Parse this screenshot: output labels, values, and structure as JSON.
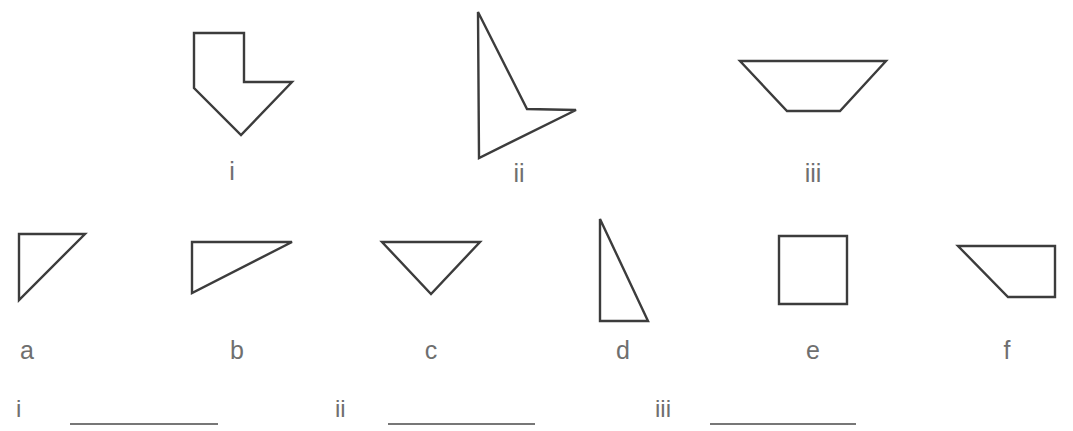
{
  "worksheet": {
    "background_color": "#ffffff",
    "stroke_color": "#3c3c3c",
    "label_color": "#6f6f6f",
    "rule_color": "#777777"
  },
  "top_row": {
    "label": "Composite figures row",
    "figures": [
      {
        "id": "figure-i",
        "label": "i",
        "shape": "arrow-hexagon",
        "label_x": 232,
        "label_y": 180,
        "points": "194,33 244,33 244,82 292,82 241,135 194,88"
      },
      {
        "id": "figure-ii",
        "label": "ii",
        "shape": "concave-dart",
        "label_x": 519,
        "label_y": 182,
        "points": "478,12 527,109 576,110 479,158"
      },
      {
        "id": "figure-iii",
        "label": "iii",
        "shape": "inverted-trapezoid",
        "label_x": 813,
        "label_y": 182,
        "points": "740,61 886,61 840,111 787,111"
      }
    ]
  },
  "bottom_row": {
    "label": "Component shapes row",
    "figures": [
      {
        "id": "figure-a",
        "label": "a",
        "shape": "right-triangle",
        "label_x": 27,
        "label_y": 359,
        "points": "19,234 85,234 19,300"
      },
      {
        "id": "figure-b",
        "label": "b",
        "shape": "right-triangle-wide",
        "label_x": 237,
        "label_y": 359,
        "points": "192,242 292,242 192,293"
      },
      {
        "id": "figure-c",
        "label": "c",
        "shape": "inverted-isosceles-triangle",
        "label_x": 431,
        "label_y": 359,
        "points": "382,242 480,242 431,294"
      },
      {
        "id": "figure-d",
        "label": "d",
        "shape": "right-triangle-tall",
        "label_x": 623,
        "label_y": 359,
        "points": "600,219 600,321 648,321"
      },
      {
        "id": "figure-e",
        "label": "e",
        "shape": "square",
        "label_x": 813,
        "label_y": 359,
        "points": "779,236 847,236 847,304 779,304"
      },
      {
        "id": "figure-f",
        "label": "f",
        "shape": "right-trapezoid",
        "label_x": 1007,
        "label_y": 359,
        "points": "958,246 1055,246 1055,297 1008,297"
      }
    ]
  },
  "answers": {
    "label": "Answer blanks",
    "items": [
      {
        "id": "answer-i",
        "label": "i",
        "value": "",
        "label_x": 16,
        "label_y": 417,
        "line_x1": 70,
        "line_x2": 218,
        "line_y": 424
      },
      {
        "id": "answer-ii",
        "label": "ii",
        "value": "",
        "label_x": 335,
        "label_y": 417,
        "line_x1": 388,
        "line_x2": 535,
        "line_y": 424
      },
      {
        "id": "answer-iii",
        "label": "iii",
        "value": "",
        "label_x": 655,
        "label_y": 417,
        "line_x1": 710,
        "line_x2": 856,
        "line_y": 424
      }
    ]
  }
}
